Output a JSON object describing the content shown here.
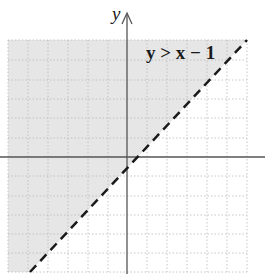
{
  "diagram": {
    "type": "inequality-graph",
    "y_axis_label": "y",
    "inequality_label": "y > x − 1",
    "boundary": {
      "slope": 1,
      "intercept": -1,
      "style": "dashed"
    },
    "shaded_region": "above boundary line",
    "grid": {
      "x_range": [
        -6,
        6
      ],
      "y_range": [
        -6,
        6
      ],
      "step": 1
    },
    "colors": {
      "shade": "#e6e6e6",
      "grid": "#b8b8b8",
      "axes": "#555555",
      "line": "#1a1a1a"
    }
  }
}
